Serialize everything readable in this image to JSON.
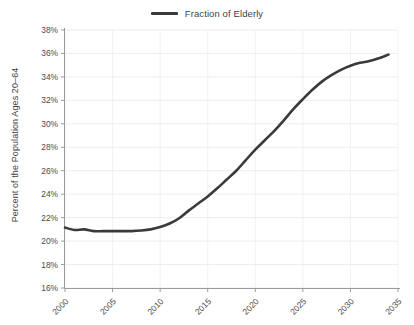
{
  "chart_data": {
    "type": "line",
    "title": "",
    "subtitle": "",
    "xlabel": "",
    "ylabel": "Percent of the Population Ages 20–64",
    "legend": {
      "position": "top-center",
      "entries": [
        {
          "name": "Fraction of Elderly",
          "color": "#3a3a3a"
        }
      ]
    },
    "grid": {
      "horizontal": true,
      "vertical": true
    },
    "xlim": [
      2000,
      2035
    ],
    "ylim": [
      16,
      38
    ],
    "x_tick_labels": [
      "2000",
      "2005",
      "2010",
      "2015",
      "2020",
      "2025",
      "2030",
      "2035"
    ],
    "x_tick_values": [
      2000,
      2005,
      2010,
      2015,
      2020,
      2025,
      2030,
      2035
    ],
    "y_tick_labels": [
      "16%",
      "18%",
      "20%",
      "22%",
      "24%",
      "26%",
      "28%",
      "30%",
      "32%",
      "34%",
      "36%",
      "38%"
    ],
    "y_tick_values": [
      16,
      18,
      20,
      22,
      24,
      26,
      28,
      30,
      32,
      34,
      36,
      38
    ],
    "x": [
      2000,
      2001,
      2002,
      2003,
      2004,
      2005,
      2006,
      2007,
      2008,
      2009,
      2010,
      2011,
      2012,
      2013,
      2014,
      2015,
      2016,
      2017,
      2018,
      2019,
      2020,
      2021,
      2022,
      2023,
      2024,
      2025,
      2026,
      2027,
      2028,
      2029,
      2030,
      2031,
      2032,
      2033,
      2034
    ],
    "series": [
      {
        "name": "Fraction of Elderly",
        "color": "#3a3a3a",
        "values": [
          21.15,
          20.95,
          21.0,
          20.85,
          20.85,
          20.85,
          20.85,
          20.85,
          20.9,
          21.0,
          21.2,
          21.5,
          21.95,
          22.6,
          23.2,
          23.8,
          24.5,
          25.25,
          26.0,
          26.9,
          27.8,
          28.6,
          29.4,
          30.3,
          31.25,
          32.1,
          32.9,
          33.6,
          34.15,
          34.6,
          34.95,
          35.2,
          35.35,
          35.6,
          35.9
        ]
      }
    ]
  },
  "axis": {
    "y_title": "Percent of the Population Ages 20–64"
  },
  "legend": {
    "label": "Fraction of Elderly"
  }
}
